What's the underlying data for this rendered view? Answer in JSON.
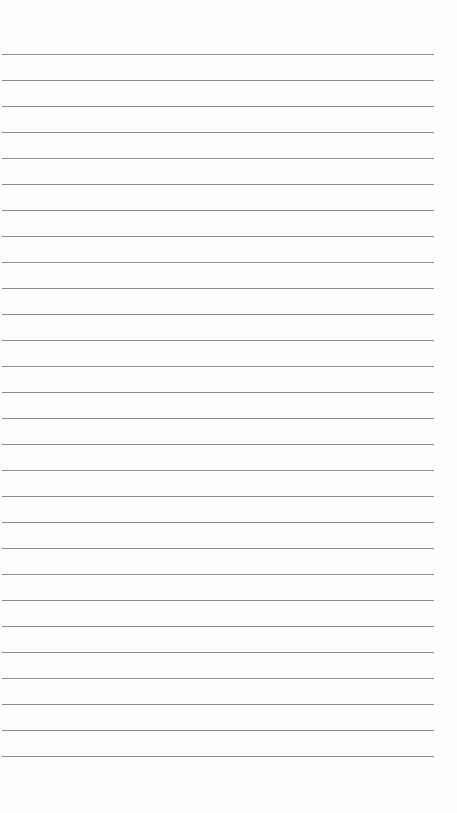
{
  "page": {
    "type": "lined-paper",
    "text": "",
    "line_count": 28,
    "first_line_y": 54,
    "line_spacing": 26,
    "line_color": "#8a8a8a",
    "background_color": "#fefefe"
  }
}
